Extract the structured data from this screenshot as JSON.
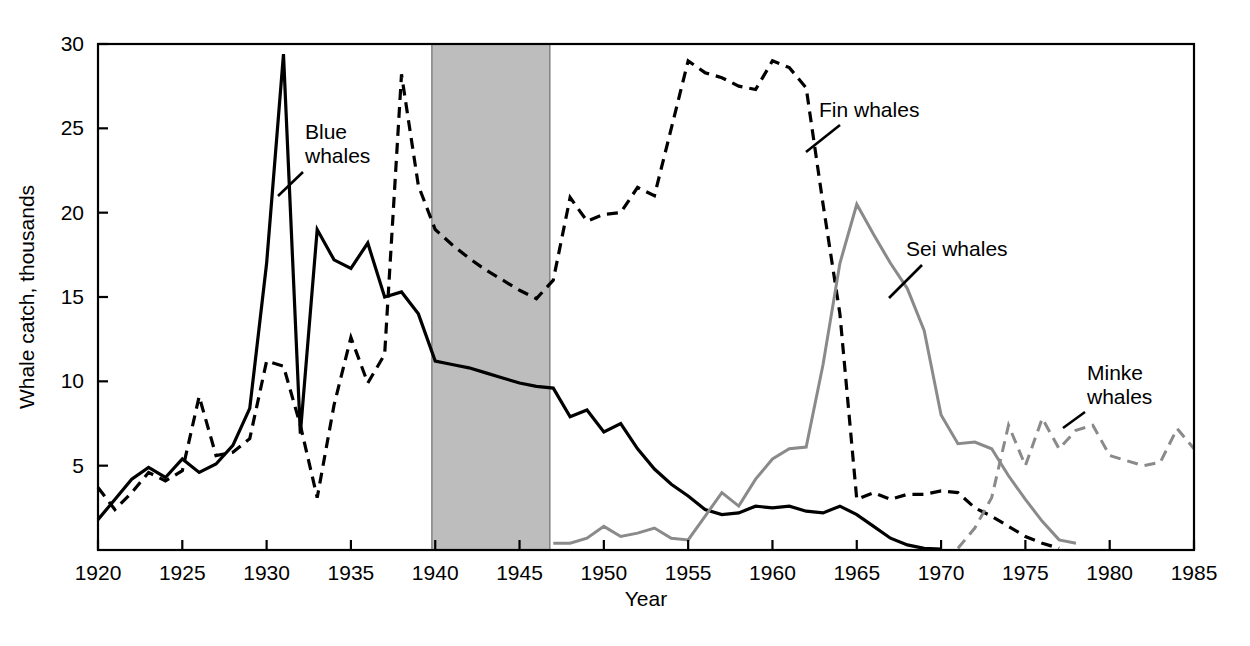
{
  "chart_data": {
    "type": "line",
    "title": "",
    "xlabel": "Year",
    "ylabel": "Whale catch, thousands",
    "xlim": [
      1920,
      1985
    ],
    "ylim": [
      0,
      30
    ],
    "grid": false,
    "legend_position": "inline-annotations",
    "xticks": [
      1920,
      1925,
      1930,
      1935,
      1940,
      1945,
      1950,
      1955,
      1960,
      1965,
      1970,
      1975,
      1980,
      1985
    ],
    "xtick_labels": [
      "1920",
      "1925",
      "1930",
      "1935",
      "1940",
      "1945",
      "1950",
      "1955",
      "1960",
      "1965",
      "1970",
      "1975",
      "1980",
      "1985"
    ],
    "yticks": [
      5,
      10,
      15,
      20,
      25,
      30
    ],
    "ytick_labels": [
      "5",
      "10",
      "15",
      "20",
      "25",
      "30"
    ],
    "annotations": [
      {
        "text": "Blue whales",
        "lines": [
          "Blue",
          "whales"
        ],
        "series": "Blue whales"
      },
      {
        "text": "Fin whales",
        "lines": [
          "Fin whales"
        ],
        "series": "Fin whales"
      },
      {
        "text": "Sei whales",
        "lines": [
          "Sei whales"
        ],
        "series": "Sei whales"
      },
      {
        "text": "Minke whales",
        "lines": [
          "Minke",
          "whales"
        ],
        "series": "Minke whales"
      }
    ],
    "shaded_regions": [
      {
        "name": "World War II",
        "x_start": 1939.8,
        "x_end": 1946.8,
        "color": "#bdbdbd"
      }
    ],
    "series": [
      {
        "name": "Blue whales",
        "color": "#000000",
        "style": "solid",
        "width": 3.2,
        "x": [
          1920,
          1921,
          1922,
          1923,
          1924,
          1925,
          1926,
          1927,
          1928,
          1929,
          1930,
          1931,
          1932,
          1933,
          1934,
          1935,
          1936,
          1937,
          1938,
          1939,
          1940,
          1941,
          1942,
          1943,
          1944,
          1945,
          1946,
          1947,
          1948,
          1949,
          1950,
          1951,
          1952,
          1953,
          1954,
          1955,
          1956,
          1957,
          1958,
          1959,
          1960,
          1961,
          1962,
          1963,
          1964,
          1965,
          1966,
          1967,
          1968,
          1969,
          1970
        ],
        "values": [
          1.8,
          3.0,
          4.2,
          4.9,
          4.3,
          5.4,
          4.6,
          5.1,
          6.2,
          8.4,
          17.0,
          29.4,
          6.9,
          19.0,
          17.2,
          16.7,
          18.2,
          15.0,
          15.3,
          14.0,
          11.2,
          11.0,
          10.8,
          10.5,
          10.2,
          9.9,
          9.7,
          9.6,
          7.9,
          8.3,
          7.0,
          7.5,
          6.0,
          4.8,
          3.9,
          3.2,
          2.4,
          2.1,
          2.2,
          2.6,
          2.5,
          2.6,
          2.3,
          2.2,
          2.6,
          2.1,
          1.4,
          0.7,
          0.3,
          0.1,
          0.05
        ]
      },
      {
        "name": "Fin whales",
        "color": "#000000",
        "style": "dashed",
        "width": 3.2,
        "x": [
          1920,
          1921,
          1922,
          1923,
          1924,
          1925,
          1926,
          1927,
          1928,
          1929,
          1930,
          1931,
          1932,
          1933,
          1934,
          1935,
          1936,
          1937,
          1938,
          1939,
          1940,
          1941,
          1942,
          1943,
          1944,
          1945,
          1946,
          1947,
          1948,
          1949,
          1950,
          1951,
          1952,
          1953,
          1954,
          1955,
          1956,
          1957,
          1958,
          1959,
          1960,
          1961,
          1962,
          1963,
          1964,
          1965,
          1966,
          1967,
          1968,
          1969,
          1970,
          1971,
          1972,
          1973,
          1974,
          1975,
          1976,
          1977
        ],
        "values": [
          3.7,
          2.4,
          3.4,
          4.6,
          4.1,
          4.7,
          9.1,
          5.6,
          5.8,
          6.6,
          11.2,
          10.9,
          7.4,
          3.1,
          8.6,
          12.6,
          9.9,
          11.6,
          28.2,
          21.6,
          19.0,
          18.1,
          17.3,
          16.6,
          16.0,
          15.4,
          14.9,
          16.0,
          20.9,
          19.5,
          19.9,
          20.0,
          21.5,
          21.0,
          25.0,
          29.0,
          28.3,
          28.0,
          27.5,
          27.3,
          29.0,
          28.6,
          27.4,
          20.5,
          14.0,
          3.0,
          3.4,
          3.0,
          3.3,
          3.3,
          3.5,
          3.4,
          2.5,
          2.0,
          1.4,
          0.8,
          0.4,
          0.1
        ]
      },
      {
        "name": "Sei whales",
        "color": "#8a8a8a",
        "style": "solid",
        "width": 3.0,
        "x": [
          1947,
          1948,
          1949,
          1950,
          1951,
          1952,
          1953,
          1954,
          1955,
          1956,
          1957,
          1958,
          1959,
          1960,
          1961,
          1962,
          1963,
          1964,
          1965,
          1966,
          1967,
          1968,
          1969,
          1970,
          1971,
          1972,
          1973,
          1974,
          1975,
          1976,
          1977,
          1978
        ],
        "values": [
          0.4,
          0.4,
          0.7,
          1.4,
          0.8,
          1.0,
          1.3,
          0.7,
          0.6,
          2.0,
          3.4,
          2.6,
          4.2,
          5.4,
          6.0,
          6.1,
          11.0,
          17.0,
          20.5,
          18.7,
          17.0,
          15.5,
          13.0,
          8.0,
          6.3,
          6.4,
          6.0,
          4.4,
          3.0,
          1.7,
          0.6,
          0.4
        ]
      },
      {
        "name": "Minke whales",
        "color": "#8a8a8a",
        "style": "dashed",
        "width": 3.0,
        "x": [
          1971,
          1972,
          1973,
          1974,
          1975,
          1976,
          1977,
          1978,
          1979,
          1980,
          1981,
          1982,
          1983,
          1984,
          1985
        ],
        "values": [
          0.1,
          1.3,
          3.1,
          7.4,
          5.0,
          7.8,
          6.0,
          7.1,
          7.4,
          5.6,
          5.3,
          5.0,
          5.2,
          7.2,
          6.0
        ]
      }
    ]
  }
}
